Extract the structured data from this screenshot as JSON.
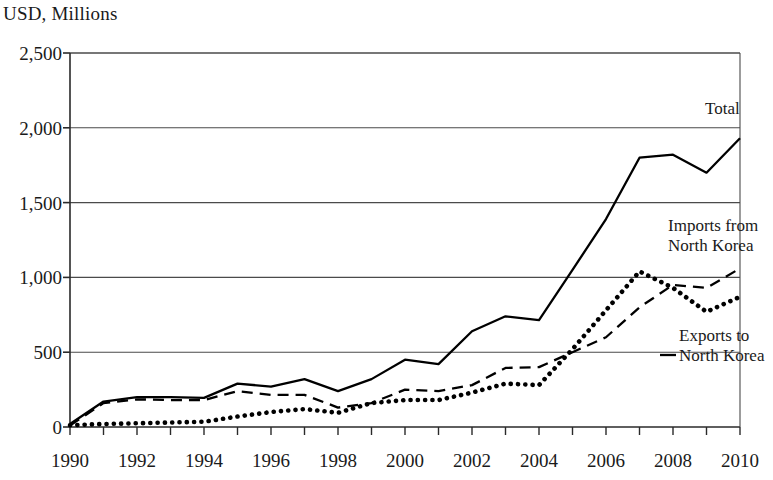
{
  "chart_data": {
    "type": "line",
    "title": "USD, Millions",
    "ylabel": "USD, Millions",
    "xlabel": "",
    "ylim": [
      0,
      2500
    ],
    "xlim": [
      1990,
      2010
    ],
    "yticks": [
      "0",
      "500",
      "1,000",
      "1,500",
      "2,000",
      "2,500"
    ],
    "ytick_values": [
      0,
      500,
      1000,
      1500,
      2000,
      2500
    ],
    "xticks": [
      "1990",
      "1992",
      "1994",
      "1996",
      "1998",
      "2000",
      "2002",
      "2004",
      "2006",
      "2008",
      "2010"
    ],
    "xtick_values": [
      1990,
      1992,
      1994,
      1996,
      1998,
      2000,
      2002,
      2004,
      2006,
      2008,
      2010
    ],
    "grid": true,
    "grid_axis": "y",
    "legend_position": "inline-right",
    "x": [
      1990,
      1991,
      1992,
      1993,
      1994,
      1995,
      1996,
      1997,
      1998,
      1999,
      2000,
      2001,
      2002,
      2003,
      2004,
      2005,
      2006,
      2007,
      2008,
      2009,
      2010
    ],
    "series": [
      {
        "name": "Total",
        "style": "solid",
        "color": "#000000",
        "label_text": "Total",
        "values": [
          20,
          170,
          200,
          200,
          195,
          290,
          270,
          320,
          240,
          320,
          450,
          420,
          640,
          740,
          715,
          1050,
          1390,
          1800,
          1820,
          1700,
          1930
        ]
      },
      {
        "name": "Imports from North Korea",
        "style": "dotted",
        "color": "#000000",
        "label_text": "Imports from\nNorth Korea",
        "label_line1": "Imports from",
        "label_line2": "North Korea",
        "values": [
          12,
          20,
          25,
          30,
          35,
          70,
          100,
          120,
          95,
          160,
          180,
          180,
          230,
          290,
          280,
          520,
          780,
          1040,
          930,
          770,
          870
        ]
      },
      {
        "name": "Exports to North Korea",
        "style": "dashed",
        "color": "#000000",
        "label_text": "Exports to\nNorth Korea",
        "label_line1": "Exports to",
        "label_line2": "North Korea",
        "values": [
          10,
          160,
          185,
          180,
          180,
          240,
          215,
          215,
          130,
          160,
          250,
          240,
          280,
          395,
          400,
          500,
          600,
          800,
          950,
          930,
          1060
        ]
      }
    ]
  }
}
